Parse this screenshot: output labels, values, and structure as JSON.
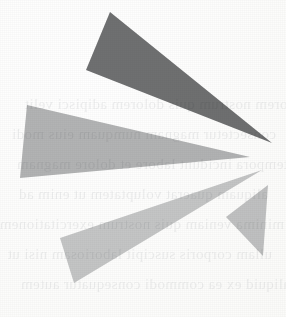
{
  "canvas": {
    "width": 286,
    "height": 317,
    "background_color": "#fdfdfc",
    "media": "scanned-paper"
  },
  "artwork": {
    "name": "converging-rays-mark",
    "description": "Abstract logo of four elongated triangular rays converging toward a point at the right",
    "convergence_point": {
      "x": 268,
      "y": 157
    },
    "ray_count": 4
  },
  "rays": [
    {
      "id": "ray-1",
      "label": "top-dark-ray",
      "color": "#6f7071",
      "points": "110,12 86,70 272,143"
    },
    {
      "id": "ray-2",
      "label": "upper-left-ray",
      "color": "#b3b4b5",
      "points": "27,105 20,178 250,157"
    },
    {
      "id": "ray-3",
      "label": "lower-left-ray",
      "color": "#c6c7c8",
      "points": "262,170 60,238 74,283"
    },
    {
      "id": "ray-4",
      "label": "lower-right-wedge",
      "color": "#c2c3c4",
      "points": "268,185 226,217 263,256"
    }
  ],
  "ghost_text": {
    "note": "illegible show-through printing from the reverse side of the sheet",
    "color": "#4a4f58",
    "lines": [
      "lorem nostrum quis dolorem adipisci velit",
      "consectetur magnam numquam eius modi",
      "tempora incidunt labore et dolore magnam",
      "aliquam quaerat voluptatem ut enim ad",
      "minima veniam quis nostrum exercitationem",
      "ullam corporis suscipit laboriosam nisi ut",
      "aliquid ex ea commodi consequatur autem"
    ]
  }
}
